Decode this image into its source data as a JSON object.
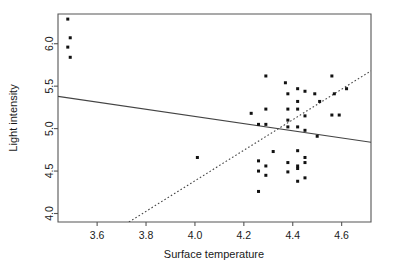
{
  "chart_data": {
    "type": "scatter",
    "title": "",
    "xlabel": "Surface temperature",
    "ylabel": "Light intensity",
    "xlim": [
      3.44,
      4.72
    ],
    "ylim": [
      3.9,
      6.35
    ],
    "xticks": [
      3.6,
      3.8,
      4.0,
      4.2,
      4.4,
      4.6
    ],
    "xtick_labels": [
      "3.6",
      "3.8",
      "4.0",
      "4.2",
      "4.4",
      "4.6"
    ],
    "yticks": [
      4.0,
      4.5,
      5.0,
      5.5,
      6.0
    ],
    "ytick_labels": [
      "4.0",
      "4.5",
      "5.0",
      "5.5",
      "6.0"
    ],
    "grid": false,
    "legend": "none",
    "marker": "filled-square",
    "marker_color": "#111111",
    "series": [
      {
        "name": "observations",
        "points": [
          [
            3.48,
            6.29
          ],
          [
            3.49,
            6.07
          ],
          [
            3.48,
            5.96
          ],
          [
            3.49,
            5.84
          ],
          [
            4.29,
            5.62
          ],
          [
            4.37,
            5.54
          ],
          [
            4.56,
            5.62
          ],
          [
            4.62,
            5.47
          ],
          [
            4.42,
            5.47
          ],
          [
            4.45,
            5.44
          ],
          [
            4.38,
            5.41
          ],
          [
            4.49,
            5.41
          ],
          [
            4.57,
            5.41
          ],
          [
            4.42,
            5.32
          ],
          [
            4.51,
            5.32
          ],
          [
            4.29,
            5.23
          ],
          [
            4.38,
            5.23
          ],
          [
            4.42,
            5.23
          ],
          [
            4.23,
            5.18
          ],
          [
            4.38,
            5.1
          ],
          [
            4.45,
            5.15
          ],
          [
            4.29,
            5.05
          ],
          [
            4.56,
            5.16
          ],
          [
            4.59,
            5.16
          ],
          [
            4.38,
            5.02
          ],
          [
            4.42,
            5.02
          ],
          [
            4.45,
            4.98
          ],
          [
            4.26,
            5.05
          ],
          [
            4.5,
            4.91
          ],
          [
            4.01,
            4.66
          ],
          [
            4.32,
            4.73
          ],
          [
            4.42,
            4.74
          ],
          [
            4.38,
            4.6
          ],
          [
            4.45,
            4.66
          ],
          [
            4.45,
            4.6
          ],
          [
            4.26,
            4.62
          ],
          [
            4.29,
            4.56
          ],
          [
            4.42,
            4.56
          ],
          [
            4.38,
            4.49
          ],
          [
            4.42,
            4.53
          ],
          [
            4.26,
            4.5
          ],
          [
            4.29,
            4.45
          ],
          [
            4.45,
            4.42
          ],
          [
            4.42,
            4.38
          ],
          [
            4.26,
            4.26
          ]
        ]
      }
    ],
    "fit_lines": [
      {
        "name": "least-squares-fit",
        "style": "solid",
        "x0": 3.44,
        "y0": 5.38,
        "x1": 4.72,
        "y1": 4.84
      },
      {
        "name": "robust-fit",
        "style": "dotted",
        "x0": 3.73,
        "y0": 3.9,
        "x1": 4.72,
        "y1": 5.68
      }
    ]
  }
}
